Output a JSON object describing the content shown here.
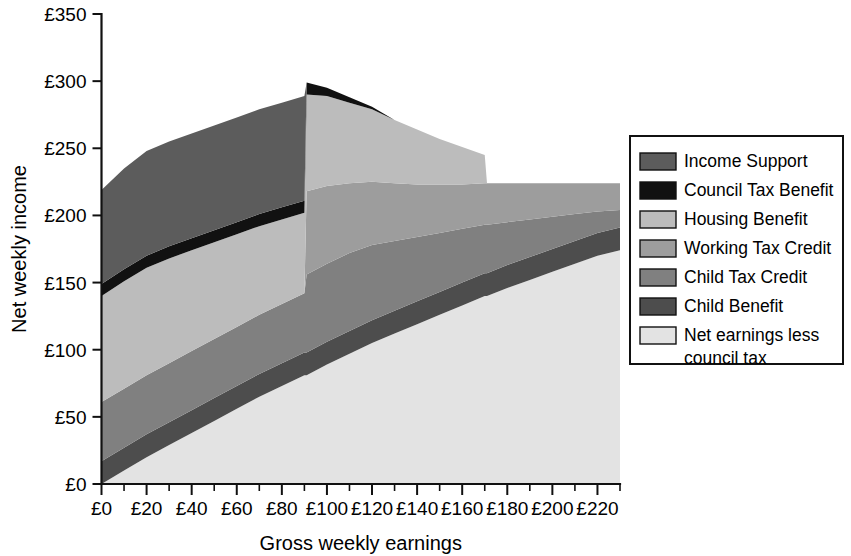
{
  "chart_data": {
    "type": "area",
    "title": "",
    "xlabel": "Gross weekly earnings",
    "ylabel": "Net weekly income",
    "xlim": [
      0,
      230
    ],
    "ylim": [
      0,
      350
    ],
    "x_tick_labels": [
      "£0",
      "£20",
      "£40",
      "£60",
      "£80",
      "£100",
      "£120",
      "£140",
      "£160",
      "£180",
      "£200",
      "£220"
    ],
    "x_tick_values": [
      0,
      20,
      40,
      60,
      80,
      100,
      120,
      140,
      160,
      180,
      200,
      220
    ],
    "x_minor_step": 10,
    "y_tick_labels": [
      "£0",
      "£50",
      "£100",
      "£150",
      "£200",
      "£250",
      "£300",
      "£350"
    ],
    "y_tick_values": [
      0,
      50,
      100,
      150,
      200,
      250,
      300,
      350
    ],
    "grid": false,
    "legend_position": "right",
    "stacked": true,
    "stack_order_bottom_to_top": [
      "Net earnings less council tax",
      "Child Benefit",
      "Child Tax Credit",
      "Working Tax Credit",
      "Housing Benefit",
      "Council Tax Benefit",
      "Income Support"
    ],
    "x": [
      0,
      10,
      20,
      30,
      40,
      50,
      60,
      70,
      80,
      90,
      91,
      100,
      110,
      120,
      130,
      140,
      150,
      160,
      170,
      171,
      180,
      190,
      200,
      210,
      220,
      230
    ],
    "series": [
      {
        "name": "Net earnings less council tax",
        "color": "#e3e3e3",
        "values": [
          0,
          10,
          20,
          29,
          38,
          47,
          56,
          65,
          73,
          81,
          81,
          89,
          97,
          105,
          112,
          119,
          126,
          133,
          140,
          140,
          146,
          152,
          158,
          164,
          170,
          174
        ]
      },
      {
        "name": "Child Benefit",
        "color": "#4d4d4d",
        "values": [
          17,
          17,
          17,
          17,
          17,
          17,
          17,
          17,
          17,
          17,
          17,
          17,
          17,
          17,
          17,
          17,
          17,
          17,
          17,
          17,
          17,
          17,
          17,
          17,
          17,
          17
        ]
      },
      {
        "name": "Child Tax Credit",
        "color": "#808080",
        "values": [
          44,
          44,
          44,
          44,
          44,
          44,
          44,
          44,
          44,
          44,
          58,
          58,
          58,
          56,
          52,
          48,
          44,
          40,
          36,
          36,
          32,
          28,
          24,
          20,
          16,
          13
        ]
      },
      {
        "name": "Working Tax Credit",
        "color": "#9d9d9d",
        "values": [
          0,
          0,
          0,
          0,
          0,
          0,
          0,
          0,
          0,
          0,
          62,
          58,
          52,
          47,
          43,
          39,
          36,
          33,
          31,
          31,
          29,
          27,
          25,
          23,
          21,
          20
        ]
      },
      {
        "name": "Housing Benefit",
        "color": "#bcbcbc",
        "values": [
          79,
          80,
          80,
          78,
          75,
          72,
          69,
          66,
          63,
          60,
          72,
          67,
          60,
          54,
          47,
          41,
          34,
          28,
          21,
          0,
          0,
          0,
          0,
          0,
          0,
          0
        ]
      },
      {
        "name": "Council Tax Benefit",
        "color": "#111111",
        "values": [
          9,
          9,
          9,
          9,
          9,
          9,
          9,
          9,
          9,
          9,
          9,
          6,
          4,
          2,
          0,
          0,
          0,
          0,
          0,
          0,
          0,
          0,
          0,
          0,
          0,
          0
        ]
      },
      {
        "name": "Income Support",
        "color": "#5c5c5c",
        "values": [
          70,
          75,
          78,
          78,
          78,
          78,
          78,
          78,
          78,
          78,
          0,
          0,
          0,
          0,
          0,
          0,
          0,
          0,
          0,
          0,
          0,
          0,
          0,
          0,
          0,
          0
        ]
      }
    ],
    "legend_entries": [
      {
        "label": "Income Support",
        "color": "#5c5c5c"
      },
      {
        "label": "Council Tax Benefit",
        "color": "#111111"
      },
      {
        "label": "Housing Benefit",
        "color": "#bcbcbc"
      },
      {
        "label": "Working Tax Credit",
        "color": "#9d9d9d"
      },
      {
        "label": "Child Tax Credit",
        "color": "#808080"
      },
      {
        "label": "Child Benefit",
        "color": "#4d4d4d"
      },
      {
        "label": "Net earnings less",
        "label2": "council tax",
        "color": "#e3e3e3"
      }
    ]
  }
}
